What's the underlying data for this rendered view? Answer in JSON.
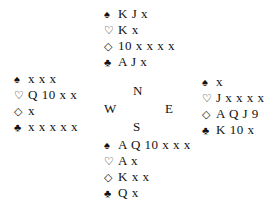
{
  "suit_symbols": {
    "spades": "♠",
    "hearts": "♡",
    "diamonds": "◇",
    "clubs": "♣"
  },
  "compass": {
    "north": "N",
    "west": "W",
    "east": "E",
    "south": "S"
  },
  "hands": {
    "north": {
      "spades": "K J x",
      "hearts": "K x",
      "diamonds": "10 x x x x",
      "clubs": "A J x"
    },
    "west": {
      "spades": "x x x",
      "hearts": "Q 10 x x",
      "diamonds": "x",
      "clubs": "x x x x x"
    },
    "east": {
      "spades": "x",
      "hearts": "J x x x x",
      "diamonds": "A Q J 9",
      "clubs": "K 10 x"
    },
    "south": {
      "spades": "A Q 10 x x x",
      "hearts": "A x",
      "diamonds": "K x x",
      "clubs": "Q x"
    }
  }
}
